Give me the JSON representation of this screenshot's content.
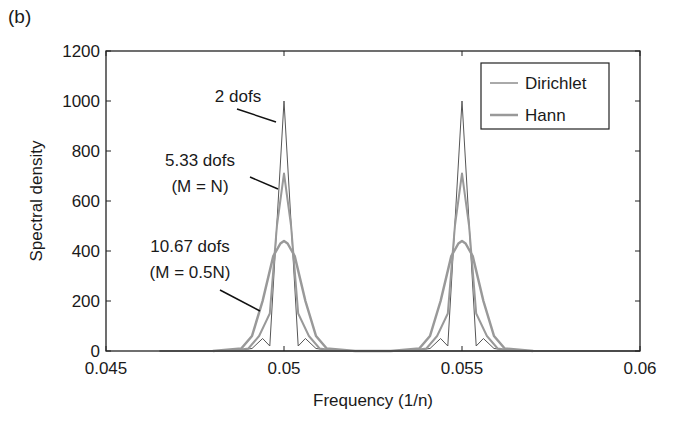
{
  "panel_label": "(b)",
  "chart_data": {
    "type": "line",
    "title": "",
    "xlabel": "Frequency (1/n)",
    "ylabel": "Spectral density",
    "xlim": [
      0.045,
      0.06
    ],
    "ylim": [
      0,
      1200
    ],
    "xticks": [
      0.045,
      0.05,
      0.055,
      0.06
    ],
    "xtick_labels": [
      "0.045",
      "0.05",
      "0.055",
      "0.06"
    ],
    "yticks": [
      0,
      200,
      400,
      600,
      800,
      1000,
      1200
    ],
    "ytick_labels": [
      "0",
      "200",
      "400",
      "600",
      "800",
      "1000",
      "1200"
    ],
    "grid": false,
    "legend_position": "upper right",
    "legend": [
      "Dirichlet",
      "Hann"
    ],
    "series": [
      {
        "name": "Dirichlet (2 dofs)",
        "color": "#555555",
        "width": 1,
        "x": [
          0.0485,
          0.0491,
          0.0494,
          0.0496,
          0.05,
          0.0504,
          0.0506,
          0.0509,
          0.0515,
          0.0535,
          0.0541,
          0.0544,
          0.0546,
          0.055,
          0.0554,
          0.0556,
          0.0559,
          0.0565
        ],
        "y": [
          0,
          10,
          50,
          20,
          1000,
          20,
          50,
          10,
          0,
          0,
          10,
          50,
          20,
          1000,
          20,
          50,
          10,
          0
        ]
      },
      {
        "name": "Hann, M=N (5.33 dofs)",
        "color": "#999999",
        "width": 2,
        "x": [
          0.0485,
          0.049,
          0.0493,
          0.0496,
          0.0498,
          0.05,
          0.0502,
          0.0504,
          0.0507,
          0.051,
          0.0515,
          0.0535,
          0.054,
          0.0543,
          0.0546,
          0.0548,
          0.055,
          0.0552,
          0.0554,
          0.0557,
          0.056,
          0.0565
        ],
        "y": [
          0,
          10,
          60,
          150,
          500,
          710,
          500,
          150,
          60,
          10,
          0,
          0,
          10,
          60,
          150,
          500,
          710,
          500,
          150,
          60,
          10,
          0
        ]
      },
      {
        "name": "Hann, M=0.5N (10.67 dofs)",
        "color": "#999999",
        "width": 2.5,
        "x": [
          0.048,
          0.0488,
          0.0491,
          0.0494,
          0.0497,
          0.0499,
          0.05,
          0.0501,
          0.0503,
          0.0506,
          0.0509,
          0.0512,
          0.052,
          0.053,
          0.0538,
          0.0541,
          0.0544,
          0.0547,
          0.0549,
          0.055,
          0.0551,
          0.0553,
          0.0556,
          0.0559,
          0.0562,
          0.057
        ],
        "y": [
          0,
          10,
          60,
          200,
          380,
          430,
          440,
          430,
          380,
          200,
          60,
          10,
          0,
          0,
          10,
          60,
          200,
          380,
          430,
          440,
          430,
          380,
          200,
          60,
          10,
          0
        ]
      }
    ],
    "annotations": [
      {
        "text": "2 dofs",
        "target_x": 0.05,
        "target_y": 950
      },
      {
        "text": "5.33 dofs",
        "text2": "(M = N)",
        "target_x": 0.05,
        "target_y": 680
      },
      {
        "text": "10.67 dofs",
        "text2": "(M = 0.5N)",
        "target_x": 0.0497,
        "target_y": 250
      }
    ]
  }
}
